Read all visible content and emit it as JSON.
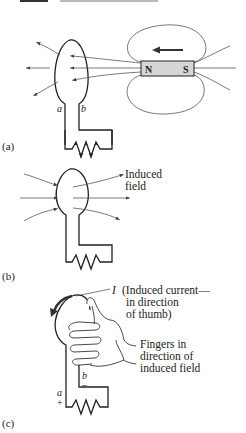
{
  "header": {
    "text": "INDUCED EMF",
    "clipped": true
  },
  "panels": [
    {
      "id": "a",
      "label": "(a)",
      "magnet": {
        "north": "N",
        "south": "S",
        "motion": "toward loop (leftward)"
      },
      "terminals": {
        "left": "a",
        "right": "b"
      }
    },
    {
      "id": "b",
      "label": "(b)",
      "annotation": [
        "Induced",
        "field"
      ]
    },
    {
      "id": "c",
      "label": "(c)",
      "current_symbol": "I",
      "current_annotation": [
        "(Induced current—",
        "in direction",
        "of thumb)"
      ],
      "fingers_annotation": [
        "Fingers in",
        "direction of",
        "induced field"
      ],
      "terminals": {
        "left": "a",
        "left_sign": "+",
        "right": "b",
        "right_sign": "–"
      }
    }
  ],
  "colors": {
    "ink": "#222222",
    "magnet_fill": "#d6d6d6",
    "field_line": "#555555"
  }
}
